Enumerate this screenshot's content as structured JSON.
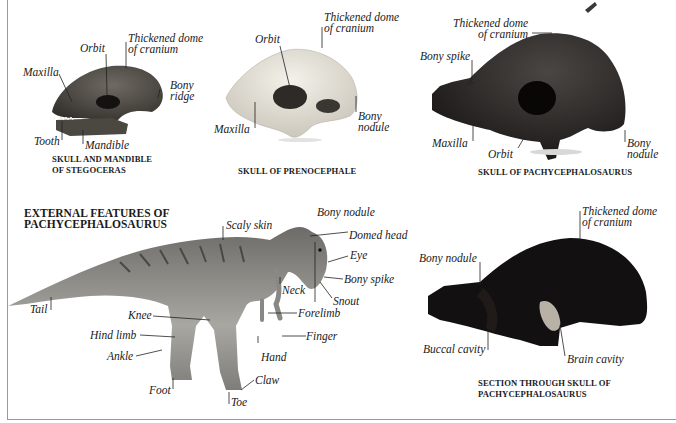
{
  "panels": {
    "stegoceras": {
      "caption_line1": "SKULL AND MANDIBLE",
      "caption_line2": "OF STEGOCERAS",
      "labels": {
        "orbit": "Orbit",
        "dome_line1": "Thickened dome",
        "dome_line2": "of cranium",
        "maxilla": "Maxilla",
        "bony_ridge_line1": "Bony",
        "bony_ridge_line2": "ridge",
        "tooth": "Tooth",
        "mandible": "Mandible"
      }
    },
    "prenocephale": {
      "caption": "SKULL OF PRENOCEPHALE",
      "labels": {
        "orbit": "Orbit",
        "dome_line1": "Thickened dome",
        "dome_line2": "of cranium",
        "maxilla": "Maxilla",
        "bony_nodule_line1": "Bony",
        "bony_nodule_line2": "nodule"
      }
    },
    "pachy_skull": {
      "caption": "SKULL OF PACHYCEPHALOSAURUS",
      "labels": {
        "dome_line1": "Thickened dome",
        "dome_line2": "of cranium",
        "bony_spike": "Bony spike",
        "maxilla": "Maxilla",
        "orbit": "Orbit",
        "bony_nodule_line1": "Bony",
        "bony_nodule_line2": "nodule"
      }
    },
    "external": {
      "title_line1": "EXTERNAL FEATURES OF",
      "title_line2": "PACHYCEPHALOSAURUS",
      "labels": {
        "scaly_skin": "Scaly skin",
        "bony_nodule": "Bony nodule",
        "domed_head": "Domed head",
        "eye": "Eye",
        "bony_spike": "Bony spike",
        "neck": "Neck",
        "snout": "Snout",
        "tail": "Tail",
        "knee": "Knee",
        "forelimb": "Forelimb",
        "hind_limb": "Hind limb",
        "finger": "Finger",
        "ankle": "Ankle",
        "hand": "Hand",
        "claw": "Claw",
        "foot": "Foot",
        "toe": "Toe"
      }
    },
    "section": {
      "caption_line1": "SECTION THROUGH SKULL OF",
      "caption_line2": "PACHYCEPHALOSAURUS",
      "labels": {
        "dome_line1": "Thickened dome",
        "dome_line2": "of cranium",
        "bony_nodule": "Bony nodule",
        "buccal_cavity": "Buccal cavity",
        "brain_cavity": "Brain cavity"
      }
    }
  },
  "colors": {
    "stegoceras_skull": "#4a4540",
    "prenocephale_skull": "#e4e0d6",
    "pachy_skull": "#2a2826",
    "section": "#121010",
    "dinosaur": "#8c8a86",
    "frame": "#9a9a9a",
    "text": "#1a1a1a"
  }
}
